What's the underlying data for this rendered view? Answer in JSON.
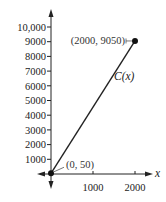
{
  "chart_data": {
    "type": "line",
    "title": "",
    "xlabel": "x",
    "ylabel": "",
    "xlim": [
      0,
      2000
    ],
    "ylim": [
      0,
      10000
    ],
    "x_ticks": [
      1000,
      2000
    ],
    "x_tick_labels": [
      "1000",
      "2000"
    ],
    "y_ticks": [
      1000,
      2000,
      3000,
      4000,
      5000,
      6000,
      7000,
      8000,
      9000,
      10000
    ],
    "y_tick_labels": [
      "1000",
      "2000",
      "3000",
      "4000",
      "5000",
      "6000",
      "7000",
      "8000",
      "9000",
      "10,000"
    ],
    "grid": false,
    "series": [
      {
        "name": "C(x)",
        "x": [
          0,
          2000
        ],
        "y": [
          50,
          9050
        ]
      }
    ],
    "points": [
      {
        "x": 0,
        "y": 50,
        "label": "(0, 50)"
      },
      {
        "x": 2000,
        "y": 9050,
        "label": "(2000, 9050)"
      }
    ],
    "curve_label": {
      "text_main": "C",
      "text_arg": "(x)"
    },
    "axis_x_symbol": "x"
  }
}
